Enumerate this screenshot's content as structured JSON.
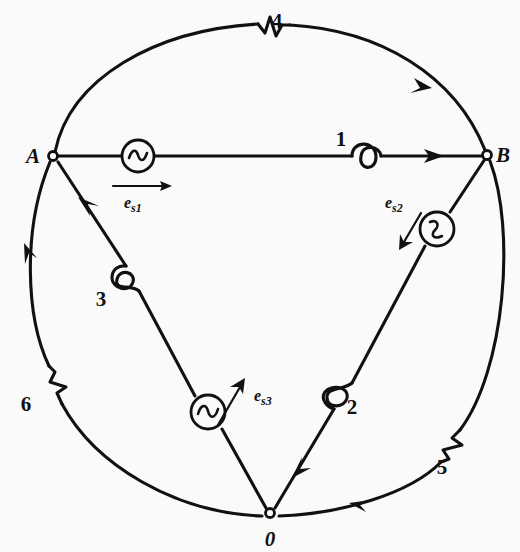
{
  "figure": {
    "background_color": "#fafafa",
    "ink_color": "#111111",
    "width": 520,
    "height": 552
  },
  "nodes": [
    {
      "id": "A",
      "label": "A",
      "x": 53,
      "y": 156,
      "label_x": 33,
      "label_y": 163
    },
    {
      "id": "B",
      "label": "B",
      "x": 487,
      "y": 155,
      "label_x": 499,
      "label_y": 162
    },
    {
      "id": "0",
      "label": "0",
      "x": 270,
      "y": 513,
      "label_x": 264,
      "label_y": 546
    }
  ],
  "branches": [
    {
      "id": "1",
      "label": "1",
      "label_x": 341,
      "label_y": 146,
      "element": "inductor",
      "from": "A",
      "to": "B",
      "shape": "straight"
    },
    {
      "id": "2",
      "label": "2",
      "label_x": 352,
      "label_y": 414,
      "element": "inductor",
      "from": "B",
      "to": "0",
      "shape": "straight"
    },
    {
      "id": "3",
      "label": "3",
      "label_x": 101,
      "label_y": 306,
      "element": "inductor",
      "from": "0",
      "to": "A",
      "shape": "straight"
    },
    {
      "id": "4",
      "label": "4",
      "label_x": 277,
      "label_y": 28,
      "element": "resistor",
      "from": "A",
      "to": "B",
      "shape": "arc-top"
    },
    {
      "id": "5",
      "label": "5",
      "label_x": 442,
      "label_y": 474,
      "element": "resistor",
      "from": "B",
      "to": "0",
      "shape": "arc-right"
    },
    {
      "id": "6",
      "label": "6",
      "label_x": 26,
      "label_y": 411,
      "element": "resistor",
      "from": "0",
      "to": "A",
      "shape": "arc-left"
    }
  ],
  "sources": [
    {
      "id": "es1",
      "symbol": "ac-source",
      "base": "e",
      "sub": "s1",
      "circle_x": 138,
      "circle_y": 156,
      "label_x": 124,
      "label_y": 207,
      "direction": "right",
      "on_branch": "1"
    },
    {
      "id": "es2",
      "symbol": "ac-source",
      "base": "e",
      "sub": "s2",
      "circle_x": 437,
      "circle_y": 229,
      "label_x": 385,
      "label_y": 207,
      "direction": "down-left",
      "on_branch": "2"
    },
    {
      "id": "es3",
      "symbol": "ac-source",
      "base": "e",
      "sub": "s3",
      "circle_x": 208,
      "circle_y": 412,
      "label_x": 236,
      "label_y": 400,
      "direction": "up-right",
      "on_branch": "3"
    }
  ],
  "flow_arrows": [
    {
      "on_branch": "1",
      "direction": "A-to-B"
    },
    {
      "on_branch": "2",
      "direction": "B-to-0"
    },
    {
      "on_branch": "3",
      "direction": "0-to-A"
    },
    {
      "on_branch": "4",
      "direction": "A-to-B"
    },
    {
      "on_branch": "5",
      "direction": "B-to-0"
    },
    {
      "on_branch": "6",
      "direction": "0-to-A"
    }
  ]
}
